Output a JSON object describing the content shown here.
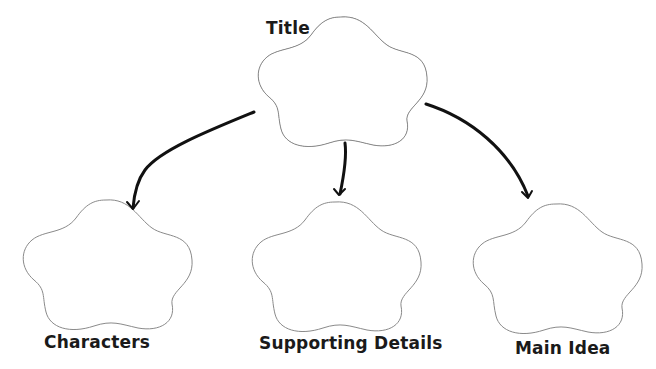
{
  "diagram": {
    "type": "graphic-organizer",
    "nodes": [
      {
        "id": "title",
        "label": "Title",
        "shape": "cloud"
      },
      {
        "id": "characters",
        "label": "Characters",
        "shape": "cloud"
      },
      {
        "id": "supporting_details",
        "label": "Supporting Details",
        "shape": "cloud"
      },
      {
        "id": "main_idea",
        "label": "Main Idea",
        "shape": "cloud"
      }
    ],
    "edges": [
      {
        "from": "title",
        "to": "characters"
      },
      {
        "from": "title",
        "to": "supporting_details"
      },
      {
        "from": "title",
        "to": "main_idea"
      }
    ],
    "colors": {
      "outline": "#8a8a8a",
      "arrow": "#111111",
      "text": "#1a1a1a",
      "background": "#ffffff"
    }
  }
}
